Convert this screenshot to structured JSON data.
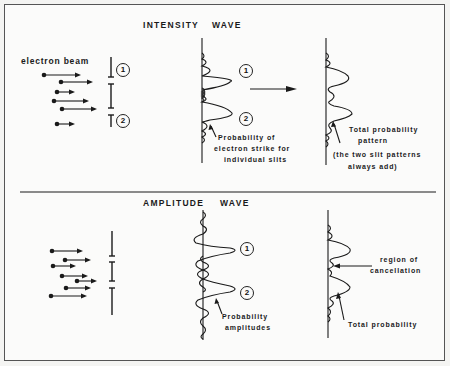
{
  "top_panel": {
    "title_left": "INTENSITY",
    "title_right": "WAVE",
    "source_label": "electron beam",
    "slit_labels": [
      "1",
      "2"
    ],
    "peak_labels": [
      "1",
      "2"
    ],
    "individual_caption": [
      "Probability of",
      "electron strike for",
      "individual slits"
    ],
    "total_caption": [
      "Total probability",
      "pattern"
    ],
    "note": [
      "(the two slit patterns",
      "always add)"
    ]
  },
  "bottom_panel": {
    "title_left": "AMPLITUDE",
    "title_right": "WAVE",
    "peak_labels": [
      "1",
      "2"
    ],
    "amplitude_caption": [
      "Probability",
      "amplitudes"
    ],
    "cancellation_caption": [
      "region of",
      "cancellation"
    ],
    "total_caption": "Total probability"
  },
  "colors": {
    "ink": "#1a1a1a",
    "paper": "#fbfbfa",
    "border": "#555555"
  }
}
